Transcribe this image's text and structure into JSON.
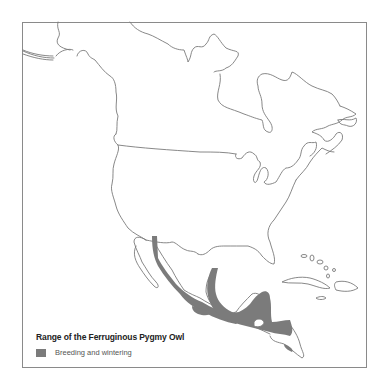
{
  "map": {
    "title": "Range of the Ferruginous Pygmy Owl",
    "region": "North and Central America",
    "colors": {
      "coastline": "#7a7a7a",
      "range_fill": "#7b7b7b",
      "background": "#ffffff"
    }
  },
  "legend": {
    "title": "Range of the Ferruginous Pygmy Owl",
    "items": [
      {
        "label": "Breeding and wintering",
        "color": "#7b7b7b"
      }
    ]
  }
}
